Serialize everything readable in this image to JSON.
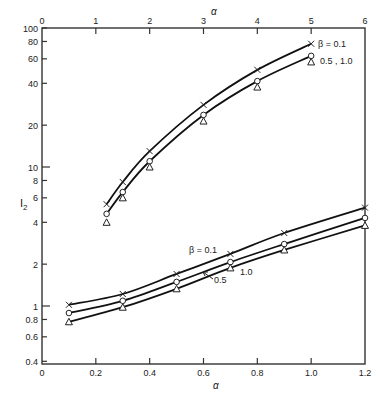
{
  "chart_data": {
    "type": "line",
    "title": "",
    "ylabel": "I2",
    "ylabel_main": "I",
    "ylabel_sub": "2",
    "yscale": "log",
    "ylim": [
      0.4,
      100
    ],
    "y_ticks": [
      {
        "value": 100,
        "label": "100"
      },
      {
        "value": 80,
        "label": "80"
      },
      {
        "value": 60,
        "label": "60"
      },
      {
        "value": 40,
        "label": "40"
      },
      {
        "value": 20,
        "label": "20"
      },
      {
        "value": 10,
        "label": "10"
      },
      {
        "value": 8,
        "label": "8"
      },
      {
        "value": 6,
        "label": "6"
      },
      {
        "value": 4,
        "label": "4"
      },
      {
        "value": 2,
        "label": "2"
      },
      {
        "value": 1,
        "label": "1"
      },
      {
        "value": 0.8,
        "label": "0.8"
      },
      {
        "value": 0.6,
        "label": "0.6"
      },
      {
        "value": 0.4,
        "label": "0.4"
      }
    ],
    "x_top": {
      "label": "α",
      "range": [
        0,
        6
      ],
      "ticks": [
        "0",
        "1",
        "2",
        "3",
        "4",
        "5",
        "6"
      ],
      "applies_to": "upper curves"
    },
    "x_bottom": {
      "label": "α",
      "range": [
        0,
        1.2
      ],
      "ticks": [
        "0",
        "0.2",
        "0.4",
        "0.6",
        "0.8",
        "1.0",
        "1.2"
      ],
      "applies_to": "lower curves"
    },
    "upper_group": {
      "x": [
        1.2,
        1.5,
        2,
        3,
        4,
        5
      ],
      "series": [
        {
          "name": "β = 0.1",
          "marker": "x",
          "values": [
            5.4,
            7.8,
            13.0,
            28,
            50,
            77
          ]
        },
        {
          "name": "β = 0.5",
          "marker": "o",
          "values": [
            4.6,
            6.6,
            11.0,
            23.7,
            41.5,
            63
          ]
        },
        {
          "name": "β = 1.0",
          "marker": "triangle",
          "values": [
            4.0,
            6.0,
            10.0,
            21.4,
            37.6,
            57
          ]
        }
      ],
      "annotations": [
        "β = 0.1",
        "0.5 , 1.0"
      ]
    },
    "lower_group": {
      "x": [
        0.1,
        0.3,
        0.5,
        0.7,
        0.9,
        1.2
      ],
      "series": [
        {
          "name": "β = 0.1",
          "marker": "x",
          "values": [
            1.02,
            1.22,
            1.7,
            2.37,
            3.35,
            5.1
          ]
        },
        {
          "name": "β = 0.5",
          "marker": "o",
          "values": [
            0.89,
            1.09,
            1.49,
            2.07,
            2.79,
            4.3
          ]
        },
        {
          "name": "β = 1.0",
          "marker": "triangle",
          "values": [
            0.77,
            0.98,
            1.33,
            1.88,
            2.53,
            3.8
          ]
        }
      ],
      "annotations": [
        "β = 0.1",
        "0.5",
        "1.0"
      ]
    },
    "grid": false,
    "legend": "inline annotations"
  },
  "labels": {
    "upper_beta": "β = 0.1",
    "upper_rest": "0.5 , 1.0",
    "lower_beta": "β = 0.1",
    "lower_05": "0.5",
    "lower_10": "1.0"
  }
}
